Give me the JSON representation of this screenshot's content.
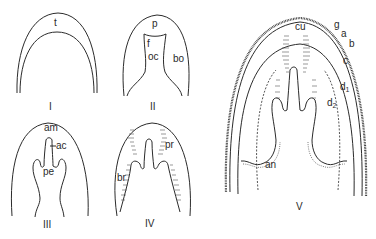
{
  "figure": {
    "panels": [
      {
        "id": "I",
        "numeral": "I",
        "labels": {
          "t": "t"
        }
      },
      {
        "id": "II",
        "numeral": "II",
        "labels": {
          "p": "p",
          "f": "f",
          "oc": "oc",
          "bo": "bo"
        }
      },
      {
        "id": "III",
        "numeral": "III",
        "labels": {
          "am": "am",
          "ac": "ac",
          "pe": "pe"
        }
      },
      {
        "id": "IV",
        "numeral": "IV",
        "labels": {
          "pr": "pr",
          "br": "br"
        }
      },
      {
        "id": "V",
        "numeral": "V",
        "labels": {
          "cu": "cu",
          "g": "g",
          "a": "a",
          "b": "b",
          "c": "c",
          "d1": "d",
          "d1_sub": "1",
          "d2": "d",
          "d2_sub": "2",
          "an": "an"
        }
      }
    ]
  },
  "colors": {
    "line": "#2b2b2b",
    "background": "#ffffff"
  }
}
